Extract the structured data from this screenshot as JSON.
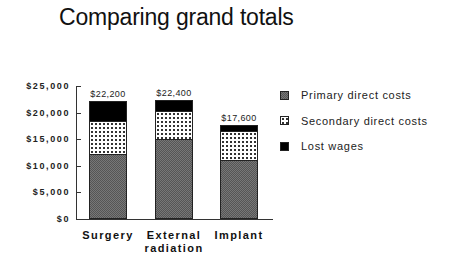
{
  "title": "Comparing grand totals",
  "y_ticks": [
    {
      "label": "$25,000",
      "value": 25000
    },
    {
      "label": "$20,000",
      "value": 20000
    },
    {
      "label": "$15,000",
      "value": 15000
    },
    {
      "label": "$10,000",
      "value": 10000
    },
    {
      "label": "$5,000",
      "value": 5000
    },
    {
      "label": "$0",
      "value": 0
    }
  ],
  "bars": [
    {
      "category_line1": "Surgery",
      "category_line2": "",
      "total_label": "$22,200",
      "primary": 12000,
      "secondary": 6500,
      "lost": 3700
    },
    {
      "category_line1": "External",
      "category_line2": "radiation",
      "total_label": "$22,400",
      "primary": 15000,
      "secondary": 5400,
      "lost": 2000
    },
    {
      "category_line1": "Implant",
      "category_line2": "",
      "total_label": "$17,600",
      "primary": 11000,
      "secondary": 5700,
      "lost": 900
    }
  ],
  "legend": [
    {
      "key": "primary",
      "label": "Primary direct costs"
    },
    {
      "key": "secondary",
      "label": "Secondary direct costs"
    },
    {
      "key": "lost",
      "label": "Lost wages"
    }
  ],
  "chart_data": {
    "type": "bar",
    "stacked": true,
    "title": "Comparing grand totals",
    "xlabel": "",
    "ylabel": "",
    "categories": [
      "Surgery",
      "External radiation",
      "Implant"
    ],
    "series": [
      {
        "name": "Primary direct costs",
        "values": [
          12000,
          15000,
          11000
        ]
      },
      {
        "name": "Secondary direct costs",
        "values": [
          6500,
          5400,
          5700
        ]
      },
      {
        "name": "Lost wages",
        "values": [
          3700,
          2000,
          900
        ]
      }
    ],
    "totals": [
      22200,
      22400,
      17600
    ],
    "data_labels": [
      "$22,200",
      "$22,400",
      "$17,600"
    ],
    "ylim": [
      0,
      25000
    ],
    "yticks": [
      "$0",
      "$5,000",
      "$10,000",
      "$15,000",
      "$20,000",
      "$25,000"
    ],
    "grid": false,
    "legend_position": "right"
  }
}
